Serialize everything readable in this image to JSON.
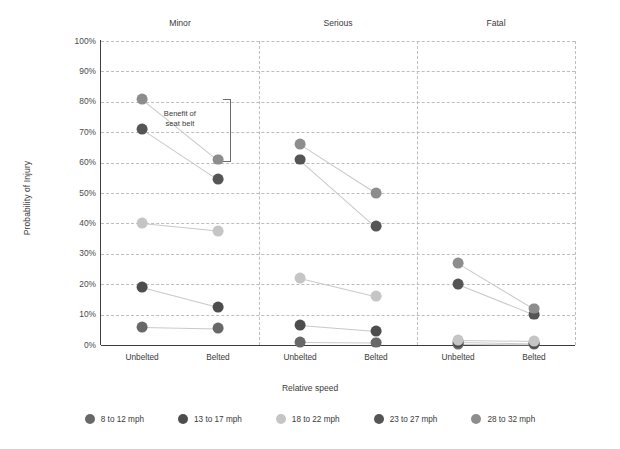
{
  "chart_data": {
    "type": "scatter",
    "title": "",
    "xlabel": "Relative speed",
    "ylabel": "Probability of Injury",
    "ylim": [
      0,
      100
    ],
    "y_unit": "%",
    "grid": true,
    "legend_position": "bottom",
    "yticks": [
      "100%",
      "90%",
      "80%",
      "70%",
      "60%",
      "50%",
      "40%",
      "30%",
      "20%",
      "10%",
      "0%"
    ],
    "ytick_values": [
      100,
      90,
      80,
      70,
      60,
      50,
      40,
      30,
      20,
      10,
      0
    ],
    "panels": [
      "Minor",
      "Serious",
      "Fatal"
    ],
    "categories": [
      "Unbelted",
      "Belted"
    ],
    "series": [
      {
        "name": "8 to 12 mph",
        "color": "#686868",
        "values": {
          "Minor": {
            "Unbelted": 6,
            "Belted": 5.5
          },
          "Serious": {
            "Unbelted": 1,
            "Belted": 0.8
          },
          "Fatal": {
            "Unbelted": 0.3,
            "Belted": 0.2
          }
        }
      },
      {
        "name": "13 to 17 mph",
        "color": "#4d4d4d",
        "values": {
          "Minor": {
            "Unbelted": 19,
            "Belted": 12.5
          },
          "Serious": {
            "Unbelted": 6.5,
            "Belted": 4.5
          },
          "Fatal": {
            "Unbelted": 1,
            "Belted": 0.5
          }
        }
      },
      {
        "name": "18 to 22 mph",
        "color": "#c5c5c5",
        "values": {
          "Minor": {
            "Unbelted": 40,
            "Belted": 37.5
          },
          "Serious": {
            "Unbelted": 22,
            "Belted": 16
          },
          "Fatal": {
            "Unbelted": 1.5,
            "Belted": 1.2
          }
        }
      },
      {
        "name": "23 to 27 mph",
        "color": "#555555",
        "values": {
          "Minor": {
            "Unbelted": 71,
            "Belted": 54.5
          },
          "Serious": {
            "Unbelted": 61,
            "Belted": 39
          },
          "Fatal": {
            "Unbelted": 20,
            "Belted": 10
          }
        }
      },
      {
        "name": "28 to 32 mph",
        "color": "#8d8d8d",
        "values": {
          "Minor": {
            "Unbelted": 81,
            "Belted": 61
          },
          "Serious": {
            "Unbelted": 66,
            "Belted": 50
          },
          "Fatal": {
            "Unbelted": 27,
            "Belted": 12
          }
        }
      }
    ],
    "annotations": [
      {
        "text": "Benefit of\nseat belt",
        "line1": "Benefit of",
        "line2": "seat belt",
        "panel": "Minor",
        "from": 81,
        "to": 61
      }
    ]
  },
  "colors": {
    "axis": "#3d3d3d",
    "grid": "#bdbdbd",
    "connector": "#c9c9c9",
    "text": "#3a3a3a",
    "background": "#ffffff"
  }
}
